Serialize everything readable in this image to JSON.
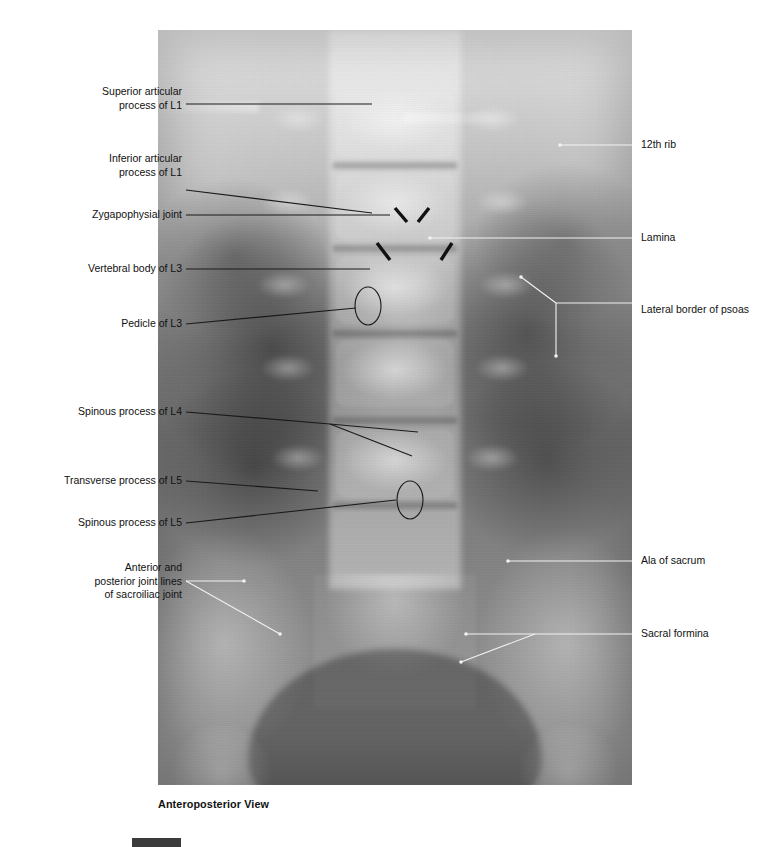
{
  "figure": {
    "caption": "Anteroposterior View",
    "plate": {
      "modality": "radiograph",
      "region": "lumbar spine",
      "view": "anteroposterior"
    },
    "labels_left": [
      {
        "id": "superior-articular-process-l1",
        "text": "Superior articular\nprocess of L1"
      },
      {
        "id": "inferior-articular-process-l1",
        "text": "Inferior articular\nprocess of L1"
      },
      {
        "id": "zygapophysial-joint",
        "text": "Zygapophysial joint"
      },
      {
        "id": "vertebral-body-l3",
        "text": "Vertebral body of L3"
      },
      {
        "id": "pedicle-l3",
        "text": "Pedicle of L3"
      },
      {
        "id": "spinous-process-l4",
        "text": "Spinous process of L4"
      },
      {
        "id": "transverse-process-l5",
        "text": "Transverse process of L5"
      },
      {
        "id": "spinous-process-l5",
        "text": "Spinous process of L5"
      },
      {
        "id": "sacroiliac-joint-lines",
        "text": "Anterior and\nposterior joint lines\nof sacroiliac joint"
      }
    ],
    "labels_right": [
      {
        "id": "twelfth-rib",
        "text": "12th rib"
      },
      {
        "id": "lamina",
        "text": "Lamina"
      },
      {
        "id": "lateral-border-of-psoas",
        "text": "Lateral border of psoas"
      },
      {
        "id": "ala-of-sacrum",
        "text": "Ala of sacrum"
      },
      {
        "id": "sacral-foramina",
        "text": "Sacral formina"
      }
    ],
    "markers": {
      "chevron_pair": "zygapophysial-joint-chevrons",
      "dash_pair": "vertebral-body-dashes",
      "oval_upper": "pedicle-l3-oval",
      "oval_lower": "spinous-process-l5-oval"
    },
    "colors": {
      "label_text": "#111111",
      "leader_dark": "#1a1a1a",
      "leader_light": "#f2f2f2",
      "swatch": "#3b3b3b"
    }
  }
}
